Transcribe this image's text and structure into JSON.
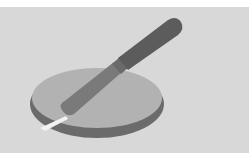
{
  "illustration": {
    "subject": "knife cutting into a round disc",
    "colors": {
      "page_background": "#ffffff",
      "panel_background": "#d8d8d8",
      "disc_top": "#b2b2b2",
      "disc_rim": "#6b6b6b",
      "knife_handle": "#5c5c5c",
      "knife_blade": "#7a7a7a",
      "cut_slit": "#f2f2f2"
    }
  }
}
